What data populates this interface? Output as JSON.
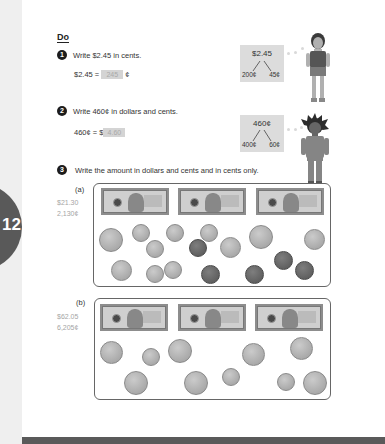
{
  "chapter": {
    "number": "12",
    "tab_color": "#595959"
  },
  "section_title": "Do",
  "questions": [
    {
      "number": "1",
      "prompt": "Write $2.45 in cents.",
      "equation_left": "$2.45 =",
      "answer": "245",
      "equation_right": "¢",
      "thought_bubble": {
        "top": "$2.45",
        "left": "200¢",
        "right": "45¢"
      }
    },
    {
      "number": "2",
      "prompt": "Write 460¢ in dollars and cents.",
      "equation_left": "460¢ = $",
      "answer": "4.60",
      "equation_right": "",
      "thought_bubble": {
        "top": "460¢",
        "left": "400¢",
        "right": "60¢"
      }
    },
    {
      "number": "3",
      "prompt": "Write the amount in dollars and cents and in cents only.",
      "parts": [
        {
          "label": "(a)",
          "answer_dollars": "$21.30",
          "answer_cents": "2,130¢",
          "bills": [
            "$10 bill",
            "$5 bill",
            "$5 bill"
          ],
          "coins": {
            "quarters": 4,
            "nickels": 7,
            "dimes": 2,
            "pennies": 5
          }
        },
        {
          "label": "(b)",
          "answer_dollars": "$62.05",
          "answer_cents": "6,205¢",
          "bills": [
            "$20 bill",
            "$20 bill",
            "$20 bill"
          ],
          "coins": {
            "quarters": 7,
            "dimes": 3
          }
        }
      ]
    }
  ],
  "colors": {
    "answer_fill": "#d4d4d4",
    "answer_text": "#a5a5a5",
    "footer": "#5a5a5a"
  }
}
